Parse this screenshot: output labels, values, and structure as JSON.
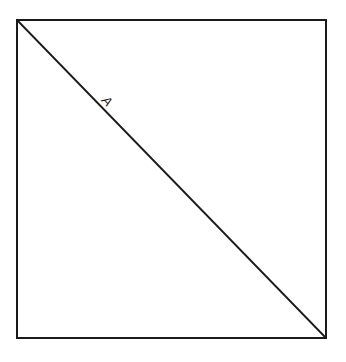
{
  "diagram": {
    "square": {
      "x": 17,
      "y": 20,
      "width": 309,
      "height": 318,
      "stroke": "#1a1a1a"
    },
    "diagonal": {
      "x1": 17,
      "y1": 20,
      "x2": 326,
      "y2": 338,
      "stroke": "#1a1a1a"
    },
    "labels": [
      {
        "text": "A",
        "x": 104,
        "y": 104,
        "rotate": 46
      }
    ]
  }
}
